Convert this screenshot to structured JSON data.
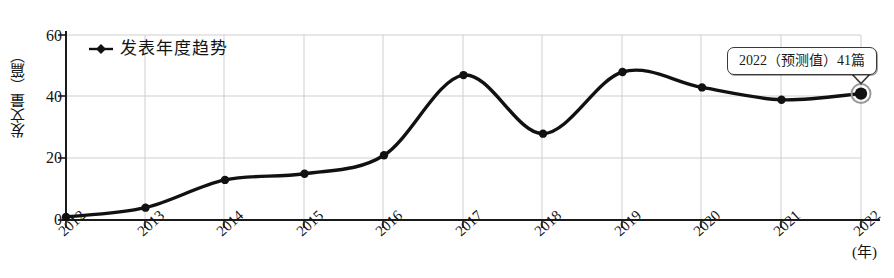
{
  "chart_data": {
    "type": "line",
    "title": "",
    "subtitle": "",
    "xlabel": "(年)",
    "ylabel": "发文量（篇）",
    "categories": [
      "2012",
      "2013",
      "2014",
      "2015",
      "2016",
      "2017",
      "2018",
      "2019",
      "2020",
      "2021",
      "2022"
    ],
    "x": [
      2012,
      2013,
      2014,
      2015,
      2016,
      2017,
      2018,
      2019,
      2020,
      2021,
      2022
    ],
    "values": [
      1,
      4,
      13,
      15,
      21,
      47,
      28,
      48,
      43,
      39,
      41
    ],
    "series": [
      {
        "name": "发表年度趋势",
        "values": [
          1,
          4,
          13,
          15,
          21,
          47,
          28,
          48,
          43,
          39,
          41
        ]
      }
    ],
    "ylim": [
      0,
      60
    ],
    "yticks": [
      0,
      20,
      40,
      60
    ],
    "ytick_labels": [
      "0",
      "20",
      "40",
      "60"
    ],
    "grid": "both",
    "legend_position": "top-left",
    "line_color": "#111111",
    "marker_color": "#111111",
    "grid_color": "#c9c9c9",
    "axis_color": "#1a1a1a",
    "annotations": [
      {
        "text": "2022（预测值）41篇",
        "target_x": 2022,
        "target_y": 41,
        "highlighted": true
      }
    ]
  },
  "legend": {
    "marker": "diamond-line-marker",
    "label": "发表年度趋势"
  },
  "axes": {
    "y_title": "发文量（篇）",
    "x_title": "(年)",
    "y_tick_labels": [
      "60",
      "40",
      "20",
      "0"
    ],
    "x_tick_labels": [
      "2012",
      "2013",
      "2014",
      "2015",
      "2016",
      "2017",
      "2018",
      "2019",
      "2020",
      "2021",
      "2022"
    ]
  },
  "annotation": {
    "text": "2022（预测值）41篇"
  }
}
